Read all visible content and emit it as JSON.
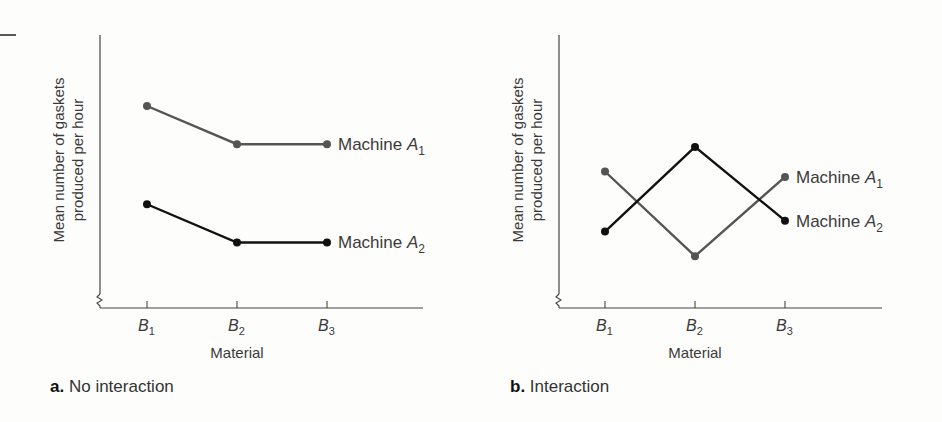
{
  "chart_data": [
    {
      "type": "line",
      "panel": "a",
      "caption_letter": "a.",
      "caption": "No interaction",
      "title": "",
      "xlabel": "Material",
      "ylabel_line1": "Mean number of gaskets",
      "ylabel_line2": "produced per hour",
      "categories": [
        "B1",
        "B2",
        "B3"
      ],
      "ylim": [
        0,
        10
      ],
      "grid": false,
      "legend_position": "inline-right",
      "series": [
        {
          "name": "Machine A1",
          "label_base": "Machine A",
          "label_sub": "1",
          "color": "#555555",
          "values": [
            7.4,
            6.0,
            6.0
          ]
        },
        {
          "name": "Machine A2",
          "label_base": "Machine A",
          "label_sub": "2",
          "color": "#111111",
          "values": [
            3.8,
            2.4,
            2.4
          ]
        }
      ]
    },
    {
      "type": "line",
      "panel": "b",
      "caption_letter": "b.",
      "caption": "Interaction",
      "title": "",
      "xlabel": "Material",
      "ylabel_line1": "Mean number of gaskets",
      "ylabel_line2": "produced per hour",
      "categories": [
        "B1",
        "B2",
        "B3"
      ],
      "ylim": [
        0,
        10
      ],
      "grid": false,
      "legend_position": "inline-right",
      "series": [
        {
          "name": "Machine A1",
          "label_base": "Machine A",
          "label_sub": "1",
          "color": "#555555",
          "values": [
            5.0,
            1.9,
            4.8
          ]
        },
        {
          "name": "Machine A2",
          "label_base": "Machine A",
          "label_sub": "2",
          "color": "#111111",
          "values": [
            2.8,
            5.9,
            3.2
          ]
        }
      ]
    }
  ],
  "tick_labels": {
    "base": "B",
    "subs": [
      "1",
      "2",
      "3"
    ]
  }
}
